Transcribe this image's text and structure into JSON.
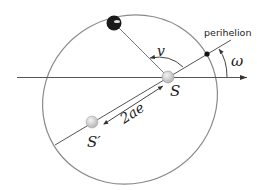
{
  "diagram": {
    "labels": {
      "perihelion": "perihelion",
      "true_anomaly": "v",
      "argument_of_perihelion": "ω",
      "focus_sun": "S",
      "empty_focus": "S′",
      "focal_distance": "2ae"
    },
    "colors": {
      "orbit": "#8a8a8a",
      "lines": "#555555",
      "planet": "#1a1a1a",
      "foci": "#cfcfcf",
      "text": "#222222"
    },
    "geometry": {
      "orbit_center": [
        130,
        99.5
      ],
      "semi_major_px": 89,
      "semi_minor_px": 83,
      "apsidal_angle_deg": 31,
      "sun": [
        168,
        77
      ],
      "empty_focus": [
        92,
        122
      ],
      "planet": [
        114,
        23
      ],
      "perihelion_point": [
        207,
        54
      ],
      "reference_axis_y": 77
    }
  }
}
